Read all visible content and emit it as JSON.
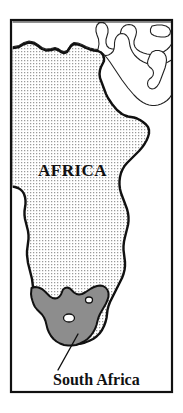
{
  "figure": {
    "kind": "reference-map",
    "title_visible": false,
    "width": 183,
    "height": 413,
    "background_color": "#ffffff",
    "frame": {
      "name": "map-border-frame",
      "x": 11,
      "y": 20,
      "width": 161,
      "height": 372,
      "stroke_color": "#111111",
      "stroke_width": 2.2,
      "fill": "none"
    }
  },
  "labels": {
    "continent": {
      "text": "AFRICA",
      "x": 38,
      "y": 176,
      "color": "#111111"
    },
    "country": {
      "text": "South Africa",
      "x": 53,
      "y": 385,
      "color": "#111111"
    }
  },
  "leader_line": {
    "name": "south-africa-leader-line",
    "x1": 78,
    "y1": 334,
    "x2": 58,
    "y2": 370,
    "stroke_color": "#111111",
    "stroke_width": 1.4
  },
  "regions": [
    {
      "name": "sub-saharan-africa-stipple",
      "style": "dotted-stipple",
      "fill_color": "#ffffff",
      "dot_color": "#9a9a9a",
      "dot_spacing_px": 3,
      "outline_color": "#111111",
      "outline_width": 2.4
    },
    {
      "name": "south-africa-shaded",
      "style": "solid-gray",
      "fill_color": "#8d8d8d",
      "outline_color": "#111111",
      "outline_width": 2.0
    },
    {
      "name": "lesotho-enclave",
      "style": "hole",
      "fill_color": "#ffffff"
    },
    {
      "name": "swaziland-enclave",
      "style": "hole",
      "fill_color": "#ffffff"
    },
    {
      "name": "north-africa-unshaded",
      "style": "thin-outline",
      "fill_color": "#ffffff",
      "outline_color": "#222222",
      "outline_width": 1.1
    },
    {
      "name": "arabian-peninsula-fragments",
      "style": "thin-outline",
      "fill_color": "#ffffff",
      "outline_color": "#222222",
      "outline_width": 1.1
    },
    {
      "name": "red-sea-channel",
      "style": "thin-outline",
      "fill_color": "#ffffff",
      "outline_color": "#222222",
      "outline_width": 1.1
    }
  ],
  "geometry": {
    "africa_shaded_path": "M 11.5 48.5 L 19 47 L 24 44 L 29 42.5 L 34 43.5 L 38 46 L 42 49 L 46 50.5 L 51 50 L 55 49 L 58 50 L 61 52 L 64 53 L 67 52 L 69 49 L 71 46 L 74 44 L 78 44.5 L 82 46 L 86 48 L 90 49.5 L 94 50.5 L 98 51 L 101 52.5 L 103 55 L 104 58 L 104 61 L 103 63 L 102 65 L 101 67 L 100 70 L 99.5 74 L 100 78 L 101.5 82 L 103 86 L 104.5 90 L 106 94 L 108 98 L 110 101 L 112 104 L 114.5 107 L 117 110 L 119.5 112 L 122 114 L 125 115.5 L 128 116.5 L 131 117 L 134 117.5 L 137 118.5 L 140 120 L 143 122 L 146 124.5 L 148 127 L 149 130 L 149 133.5 L 148 137 L 146.5 140.5 L 144.5 144 L 142 147.5 L 139 151 L 136 154 L 133 157 L 130 160 L 127 163 L 124.5 166 L 122.5 169.5 L 121 173 L 120 177 L 119.5 181 L 119.5 185 L 120 189 L 121 193 L 122.5 197 L 124 201 L 125.5 205 L 127 209 L 128 213 L 128.5 217 L 128.5 221 L 128 225 L 127 229 L 126 233 L 125 237 L 124 241.5 L 123.5 246 L 123.5 250 L 124 254 L 124.5 258 L 125 262 L 125 266 L 124.5 270 L 123.5 274 L 122 278 L 120 282 L 118 286 L 116 290 L 114 294 L 112 298 L 110 302 L 108.5 306 L 107.5 310 L 107 314 L 106.5 318 L 105.5 322 L 104 326 L 102 330 L 99.5 333.5 L 96.5 336.5 L 93 339 L 89 341 L 85 342.5 L 81 343.5 L 77 344 L 73 344 L 69 343.5 L 65 342.5 L 61 341 L 57.5 339 L 54.5 336.5 L 52 333.5 L 50 330 L 48.5 326.5 L 47.5 323 L 46.5 319 L 45 315 L 43 311.5 L 41 308.5 L 39 306 L 37 303.5 L 35.5 301 L 34.5 298 L 34 294.5 L 33.5 291 L 33 287 L 32.5 283 L 32 279 L 31 275 L 30 271 L 29 267 L 28 263 L 27.5 259 L 27 255 L 27 251 L 27.5 247 L 28 243 L 28.5 239 L 28.5 235 L 28 231 L 27 227 L 26 223 L 25 219 L 24.5 215 L 24.5 211 L 25 207.5 L 25.5 204 L 25.5 200.5 L 25 197 L 24 194 L 22.5 191.5 L 20.5 189.5 L 18 188 L 15 187 L 11.5 186.5 Z",
    "south_africa_path": "M 31.5 288 L 35 287 L 38.5 287.5 L 42 289 L 45 291.5 L 47.5 294 L 50 296.5 L 52.5 298 L 55 298.5 L 57.5 298 L 59.5 296.5 L 61 294.5 L 62 292 L 63 289.5 L 65 288 L 67.5 287.5 L 70 288.5 L 72 290.5 L 74 292.5 L 76.5 294 L 79 294.5 L 82 294 L 85 292.5 L 88 290.5 L 91 288.5 L 94 287 L 97 286 L 100 285.5 L 103 286 L 105.5 287.5 L 107.5 290 L 108.5 293 L 108.5 296.5 L 107.5 300 L 106 303.5 L 104 307 L 102 310.5 L 100 314 L 98.5 317.5 L 97.5 321 L 96.5 325 L 95 329 L 93 332.5 L 90.5 336 L 87.5 339 L 84 341.5 L 80 343.5 L 76 345 L 72 345.5 L 68 345.5 L 64 345 L 60 343.5 L 56.5 341.5 L 53.5 339 L 51 336 L 49 332.5 L 47.5 329 L 46.5 325 L 45.5 321 L 44 317.5 L 42 314.5 L 39.5 312 L 37 309.5 L 35 307 L 33.5 304 L 32.5 301 L 31.5 297.5 L 31 294 Z",
    "lesotho_path": "M 69 318 m -5.5 0 a 5.5 4 0 1 0 11 0 a 5.5 4 0 1 0 -11 0 Z",
    "swaziland_path": "M 89 300 m -3.5 0 a 3.5 3 0 1 0 7 0 a 3.5 3 0 1 0 -7 0 Z",
    "north_africa_path": "M 11.5 22 L 11.5 47 L 19 45.5 L 24 42.5 L 29 41 L 34 42 L 38 44.5 L 42 47.5 L 46 49 L 51 48.5 L 55 47.5 L 58 48.5 L 61 50.5 L 64 51.5 L 67 50.5 L 69 47.5 L 71 44.5 L 74 42.5 L 78 43 L 82 44.5 L 86 46.5 L 90 48 L 94 49 L 98 49.5 L 99 44 L 98.5 39 L 97 35 L 96 31.5 L 96 28 L 97 25 L 99 23 L 102 22.5 L 105 23.5 L 107 26 L 108 29 L 108 32.5 L 107 36 L 106 39.5 L 106 43 L 107 46 L 109 48 L 112 49 L 115 49 L 118 48 L 120 46 L 121 43 L 121 39.5 L 120.5 36 L 120.5 32.5 L 121.5 29 L 123.5 26.5 L 126 25 L 129 24.5 L 132 25 L 134.5 26.5 L 136 29 L 136.5 32 L 136 35 L 135 38 L 134 41 L 134 44 L 135 47 L 137 49.5 L 140 51.5 L 143.5 53 L 147 54 L 150.5 54.5 L 154 54.5 L 157.5 54 L 161 53 L 164 51.5 L 167 49.5 L 169.5 47 L 171.5 44 L 171.5 22 Z",
    "red_sea_path": "M 101 52 L 104 54.5 L 107 58 L 110 62 L 113 66.5 L 116 71 L 119 75.5 L 122 80 L 125 84 L 128 88 L 131 91.5 L 134 95 L 137 98 L 140 100.5 L 143 102.5 L 146 104 L 149 105 L 152 105.5 L 155 105.5 L 158 105 L 161 104 L 164 102.5 L 167 100.5 L 169.5 98 L 171.5 95 L 171.5 60 L 168 62 L 164.5 63.5 L 161 64.5 L 157.5 65 L 154 65 L 150.5 64.5 L 147 63.5 L 143.5 62 L 140 60 L 137 57.5 L 134.5 55 L 132.5 52 L 131 49 L 130 46 L 129.5 43 L 129 40 L 128 37.5 L 126.5 35.5 L 124.5 34 L 122 33.5 L 119.5 34 L 117.5 35.5 L 116 37.5 L 115 40 L 114.5 43 L 114.5 46 L 114 49 L 113 51.5 L 111 53.5 L 108.5 55 L 106 55.5 L 103.5 55 Z",
    "arabia_shape_1": "M 152 26 L 157 25 L 162 25 L 166 26 L 169 28 L 170.5 31 L 170 34 L 168 36 L 165 37 L 161 37 L 157 36.5 L 154 35.5 L 151.5 34 L 150.5 32 L 150.5 29 Z",
    "arabia_shape_2": "M 152 52 L 155.5 50.5 L 159 50.5 L 162 51.5 L 164.5 53.5 L 166 56.5 L 166.5 60 L 166 64 L 165 68 L 163.5 72 L 162 76 L 160.5 80 L 159 83.5 L 157 86.5 L 154.5 88.5 L 152 89 L 149.5 88 L 148 86 L 147.5 83.5 L 148 81 L 149.5 79 L 151.5 77.5 L 153 75.5 L 153.5 73 L 153 70.5 L 151.5 68.5 L 149.5 67 L 148 65 L 147.5 62.5 L 148 60 L 149 57.5 L 150 55 Z"
  },
  "colors": {
    "ink": "#111111",
    "thin_ink": "#222222",
    "shaded_country": "#8d8d8d",
    "stipple_dot": "#9a9a9a",
    "paper": "#ffffff"
  }
}
